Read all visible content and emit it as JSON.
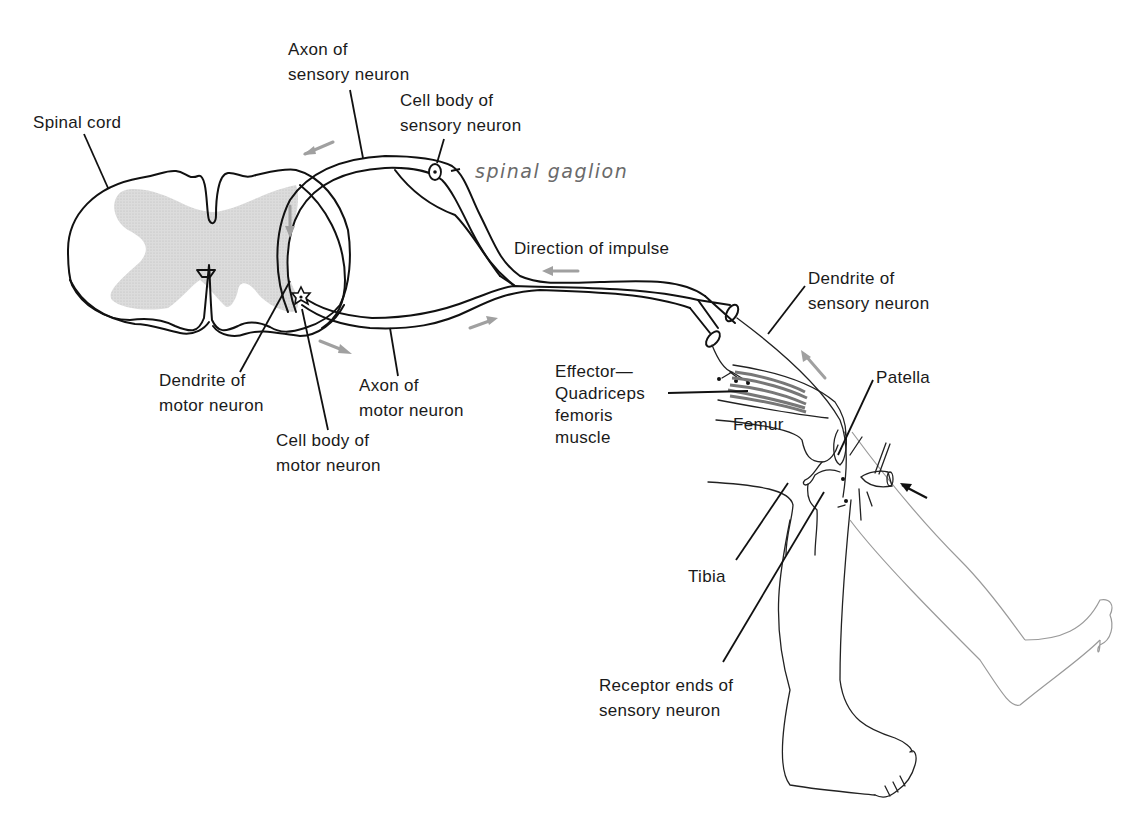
{
  "figure": {
    "labels": {
      "spinal_cord": "Spinal cord",
      "axon_sensory": [
        "Axon of",
        "sensory neuron"
      ],
      "cell_body_sensory": [
        "Cell body of",
        "sensory neuron"
      ],
      "spinal_ganglion": "spinal gaglion",
      "direction_of_impulse": "Direction of impulse",
      "dendrite_sensory": [
        "Dendrite of",
        "sensory neuron"
      ],
      "effector": [
        "Effector—",
        "Quadriceps",
        "femoris",
        "muscle"
      ],
      "patella": "Patella",
      "femur": "Femur",
      "dendrite_motor": [
        "Dendrite of",
        "motor neuron"
      ],
      "axon_motor": [
        "Axon of",
        "motor neuron"
      ],
      "cell_body_motor": [
        "Cell body of",
        "motor neuron"
      ],
      "tibia": "Tibia",
      "receptor_ends": [
        "Receptor ends of",
        "sensory neuron"
      ]
    },
    "colors": {
      "ink": "#111111",
      "gray_matter": "#d4d4d4",
      "muscle": "#8a8a8a",
      "arrow": "#a0a0a0",
      "handwriting": "#6a6a6a"
    }
  }
}
